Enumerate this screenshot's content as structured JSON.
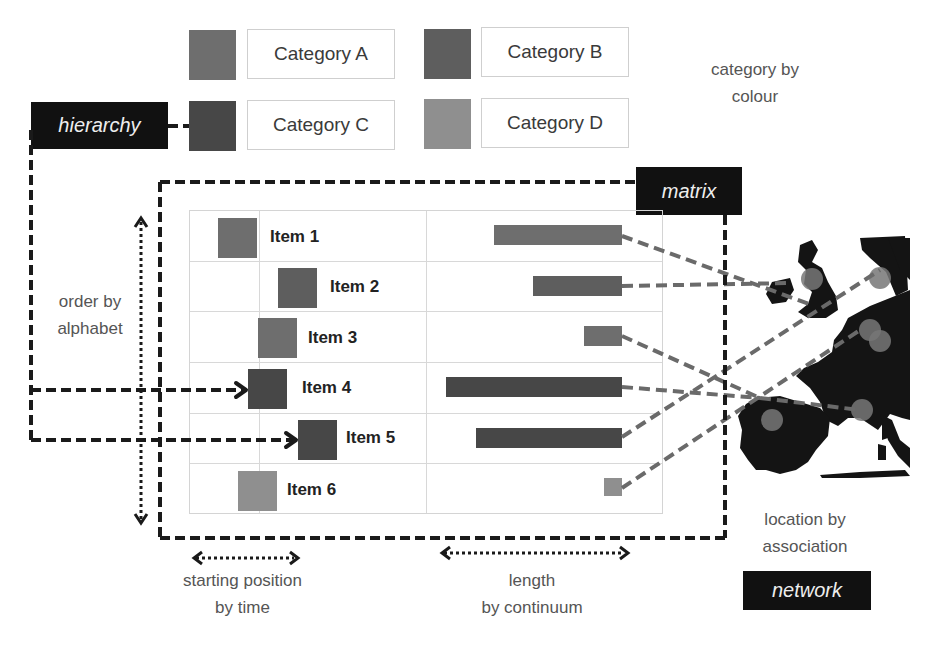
{
  "colors": {
    "category_a": "#6e6e6e",
    "category_b": "#5e5e5e",
    "category_c": "#474747",
    "category_d": "#8f8f8f",
    "tag_bg": "#111111",
    "tag_text": "#eeeeee",
    "line": "#6a6a6a",
    "map": "#141414"
  },
  "legend": {
    "title": [
      "category by",
      "colour"
    ],
    "categories": [
      {
        "label": "Category A"
      },
      {
        "label": "Category B"
      },
      {
        "label": "Category C"
      },
      {
        "label": "Category D"
      }
    ]
  },
  "tags": {
    "hierarchy": "hierarchy",
    "matrix": "matrix",
    "network": "network"
  },
  "annotations": {
    "order": [
      "order by",
      "alphabet"
    ],
    "start": [
      "starting position",
      "by time"
    ],
    "length": [
      "length",
      "by continuum"
    ],
    "location": [
      "location by",
      "association"
    ]
  },
  "items": [
    {
      "label": "Item 1",
      "category": "A",
      "start_x": 218,
      "bar_left": 494
    },
    {
      "label": "Item 2",
      "category": "B",
      "start_x": 278,
      "bar_left": 533
    },
    {
      "label": "Item 3",
      "category": "A",
      "start_x": 258,
      "bar_left": 584
    },
    {
      "label": "Item 4",
      "category": "C",
      "start_x": 248,
      "bar_left": 446
    },
    {
      "label": "Item 5",
      "category": "C",
      "start_x": 298,
      "bar_left": 476
    },
    {
      "label": "Item 6",
      "category": "D",
      "start_x": 238,
      "bar_left": 604
    }
  ]
}
